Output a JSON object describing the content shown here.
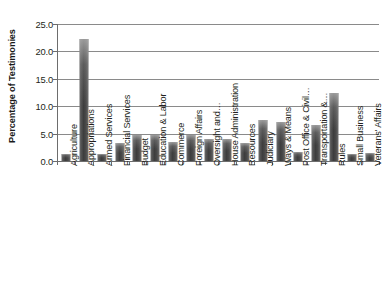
{
  "chart_data": {
    "type": "bar",
    "title": "",
    "subtitle": "",
    "xlabel": "",
    "ylabel": "Percentage of Testimonies",
    "ylim": [
      0.0,
      25.0
    ],
    "ytick_step": 5.0,
    "ytick_labels": [
      "25.0",
      "20.0",
      "15.0",
      "10.0",
      "5.0",
      "0.0"
    ],
    "ytick_values": [
      25.0,
      20.0,
      15.0,
      10.0,
      5.0,
      0.0
    ],
    "grid": "horizontal",
    "legend": "none",
    "orientation": "vertical",
    "bar_color": "#4a4a4a",
    "gridline_color": "#8a8a8a",
    "axis_color": "#6d6d6d",
    "xtick_label_rotation": -90,
    "categories": [
      "Agriculture",
      "Appropriations",
      "Armed Services",
      "Financial Services",
      "Budget",
      "Education & Labor",
      "Commerce",
      "Foreign Affairs",
      "Oversight and…",
      "House Administration",
      "Resources",
      "Judiciary",
      "Ways & Means",
      "Post Office & Civil…",
      "Transportation &…",
      "Rules",
      "Small Business",
      "Veterans' Affairs"
    ],
    "values": [
      1.3,
      22.3,
      1.2,
      3.2,
      4.8,
      4.8,
      3.4,
      4.8,
      4.0,
      4.1,
      3.3,
      7.4,
      7.1,
      1.7,
      6.5,
      12.4,
      1.3,
      1.4
    ]
  },
  "axis": {
    "y_title": "Percentage of Testimonies"
  }
}
